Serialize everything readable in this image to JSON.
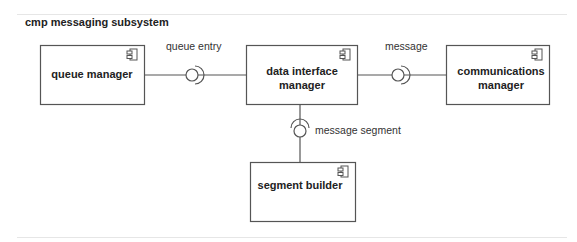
{
  "diagram": {
    "title": "cmp messaging subsystem",
    "components": [
      {
        "id": "queue-manager",
        "label_lines": [
          "queue manager"
        ]
      },
      {
        "id": "data-interface-manager",
        "label_lines": [
          "data interface",
          "manager"
        ]
      },
      {
        "id": "communications-manager",
        "label_lines": [
          "communications",
          "manager"
        ]
      },
      {
        "id": "segment-builder",
        "label_lines": [
          "segment builder"
        ]
      }
    ],
    "interfaces": [
      {
        "label": "queue entry",
        "from": "queue-manager",
        "to": "data-interface-manager"
      },
      {
        "label": "message",
        "from": "data-interface-manager",
        "to": "communications-manager"
      },
      {
        "label": "message segment",
        "from": "data-interface-manager",
        "to": "segment-builder"
      }
    ],
    "colors": {
      "line": "#555555",
      "text": "#222222",
      "divider": "#e6e6e6"
    }
  }
}
